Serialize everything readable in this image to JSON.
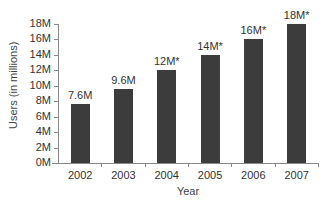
{
  "chart_data": {
    "type": "bar",
    "title": "",
    "xlabel": "Year",
    "ylabel": "Users (in millions)",
    "categories": [
      "2002",
      "2003",
      "2004",
      "2005",
      "2006",
      "2007"
    ],
    "values": [
      7.6,
      9.6,
      12,
      14,
      16,
      18
    ],
    "data_labels": [
      "7.6M",
      "9.6M",
      "12M*",
      "14M*",
      "16M*",
      "18M*"
    ],
    "ylim": [
      0,
      18
    ],
    "yticks": [
      0,
      2,
      4,
      6,
      8,
      10,
      12,
      14,
      16,
      18
    ],
    "ytick_labels": [
      "0M",
      "2M",
      "4M",
      "6M",
      "8M",
      "10M",
      "12M",
      "14M",
      "16M",
      "18M"
    ],
    "grid": false,
    "legend": null,
    "bar_color": "#3c3c3c"
  }
}
